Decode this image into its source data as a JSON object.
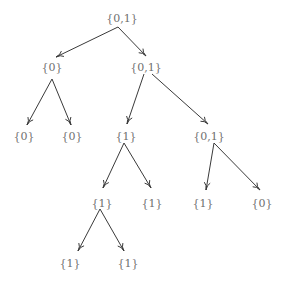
{
  "diagram": {
    "type": "tree",
    "colors": {
      "label": "#6f6f6f",
      "edge": "#3a3a3a",
      "background": "#ffffff"
    },
    "nodes": [
      {
        "id": "n0",
        "label": "{0,1}",
        "x": 122,
        "y": 18
      },
      {
        "id": "n1",
        "label": "{0}",
        "x": 52,
        "y": 67
      },
      {
        "id": "n2",
        "label": "{0,1}",
        "x": 146,
        "y": 67
      },
      {
        "id": "n3",
        "label": "{0}",
        "x": 24,
        "y": 136
      },
      {
        "id": "n4",
        "label": "{0}",
        "x": 72,
        "y": 136
      },
      {
        "id": "n5",
        "label": "{1}",
        "x": 126,
        "y": 136
      },
      {
        "id": "n6",
        "label": "{0,1}",
        "x": 209,
        "y": 136
      },
      {
        "id": "n7",
        "label": "{1}",
        "x": 102,
        "y": 203
      },
      {
        "id": "n8",
        "label": "{1}",
        "x": 152,
        "y": 203
      },
      {
        "id": "n9",
        "label": "{1}",
        "x": 203,
        "y": 203
      },
      {
        "id": "n10",
        "label": "{0}",
        "x": 262,
        "y": 203
      },
      {
        "id": "n11",
        "label": "{1}",
        "x": 70,
        "y": 263
      },
      {
        "id": "n12",
        "label": "{1}",
        "x": 128,
        "y": 263
      }
    ],
    "edges": [
      {
        "from": "n0",
        "to": "n1",
        "x1": 118,
        "y1": 27,
        "x2": 56,
        "y2": 57
      },
      {
        "from": "n0",
        "to": "n2",
        "x1": 118,
        "y1": 27,
        "x2": 146,
        "y2": 56
      },
      {
        "from": "n1",
        "to": "n3",
        "x1": 52,
        "y1": 79,
        "x2": 27,
        "y2": 125
      },
      {
        "from": "n1",
        "to": "n4",
        "x1": 52,
        "y1": 79,
        "x2": 71,
        "y2": 125
      },
      {
        "from": "n2",
        "to": "n5",
        "x1": 144,
        "y1": 74,
        "x2": 127,
        "y2": 124
      },
      {
        "from": "n2",
        "to": "n6",
        "x1": 152,
        "y1": 74,
        "x2": 208,
        "y2": 124
      },
      {
        "from": "n5",
        "to": "n7",
        "x1": 124,
        "y1": 143,
        "x2": 103,
        "y2": 188
      },
      {
        "from": "n5",
        "to": "n8",
        "x1": 124,
        "y1": 143,
        "x2": 151,
        "y2": 188
      },
      {
        "from": "n6",
        "to": "n9",
        "x1": 214,
        "y1": 143,
        "x2": 206,
        "y2": 190
      },
      {
        "from": "n6",
        "to": "n10",
        "x1": 214,
        "y1": 143,
        "x2": 260,
        "y2": 190
      },
      {
        "from": "n7",
        "to": "n11",
        "x1": 100,
        "y1": 209,
        "x2": 78,
        "y2": 251
      },
      {
        "from": "n7",
        "to": "n12",
        "x1": 100,
        "y1": 209,
        "x2": 124,
        "y2": 251
      }
    ]
  }
}
